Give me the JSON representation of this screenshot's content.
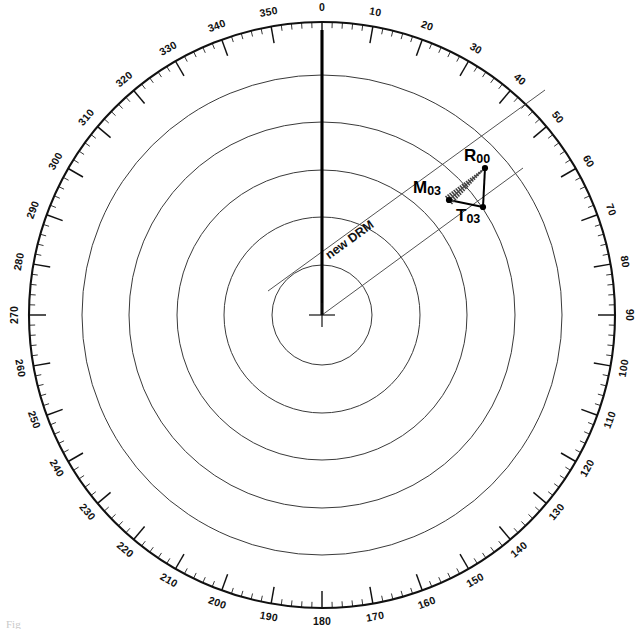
{
  "figure": {
    "caption": "Fig"
  },
  "compass": {
    "center": {
      "x": 322,
      "y": 315
    },
    "outer_radius": 293,
    "tick_start_radius": 293,
    "label_radius": 307,
    "tick_len_major": 17,
    "tick_len_mid": 11,
    "tick_len_minor": 6,
    "major_step_deg": 10,
    "mid_step_deg": 5,
    "minor_step_deg": 2,
    "degree_labels": [
      "0",
      "10",
      "20",
      "30",
      "40",
      "50",
      "60",
      "70",
      "80",
      "90",
      "100",
      "110",
      "120",
      "130",
      "140",
      "150",
      "160",
      "170",
      "180",
      "190",
      "200",
      "210",
      "220",
      "230",
      "240",
      "250",
      "260",
      "270",
      "280",
      "290",
      "300",
      "310",
      "320",
      "330",
      "340",
      "350"
    ],
    "range_ring_radii": [
      50,
      98,
      145,
      193,
      240
    ],
    "range_ring_count": 5
  },
  "heading_marker": {
    "label": "ship-heading-flasher",
    "bearing_deg": 0,
    "length": 285
  },
  "drm": {
    "label": "new DRM",
    "label_x": 352,
    "label_y": 243,
    "label_rotation_deg": -36,
    "line_from": {
      "x": 268,
      "y": 291
    },
    "line_to": {
      "x": 545,
      "y": 90
    }
  },
  "own_ship_vector": {
    "name": "own-ship-course-line",
    "from": {
      "x": 322,
      "y": 315
    },
    "to": {
      "x": 523,
      "y": 168
    }
  },
  "triangle": {
    "vertices": [
      {
        "id": "M03",
        "label_main": "M",
        "label_sub": "03",
        "x": 449,
        "y": 200,
        "label_x": 413,
        "label_y": 193
      },
      {
        "id": "R00",
        "label_main": "R",
        "label_sub": "00",
        "x": 485,
        "y": 168,
        "label_x": 464,
        "label_y": 161
      },
      {
        "id": "T03",
        "label_main": "T",
        "label_sub": "03",
        "x": 483,
        "y": 207,
        "label_x": 456,
        "label_y": 221
      }
    ],
    "edges": [
      {
        "from": "M03",
        "to": "T03",
        "style": "solid"
      },
      {
        "from": "T03",
        "to": "R00",
        "style": "solid"
      },
      {
        "from": "M03",
        "to": "R00",
        "style": "hatched"
      }
    ]
  },
  "colors": {
    "ink": "#111111",
    "ring": "#3a3a3a",
    "thin": "#4a4a4a",
    "background": "#ffffff"
  }
}
